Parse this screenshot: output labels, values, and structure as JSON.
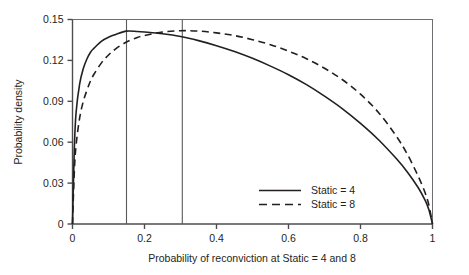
{
  "chart_data": {
    "type": "line",
    "title": "",
    "xlabel": "Probability of reconviction at Static = 4 and 8",
    "ylabel": "Probability density",
    "xlim": [
      0,
      1
    ],
    "ylim": [
      0,
      0.15
    ],
    "grid": false,
    "legend_position": "bottom-right",
    "x_ticks": [
      "0",
      "0.2",
      "0.4",
      "0.6",
      "0.8",
      "1"
    ],
    "x_tick_values": [
      0,
      0.2,
      0.4,
      0.6,
      0.8,
      1
    ],
    "y_ticks": [
      "0",
      "0.03",
      "0.06",
      "0.09",
      "0.12",
      "0.15"
    ],
    "y_tick_values": [
      0,
      0.03,
      0.06,
      0.09,
      0.12,
      0.15
    ],
    "x": [
      0,
      0.005,
      0.01,
      0.02,
      0.03,
      0.04,
      0.05,
      0.06,
      0.08,
      0.1,
      0.12,
      0.15,
      0.18,
      0.2,
      0.25,
      0.3,
      0.35,
      0.4,
      0.45,
      0.5,
      0.55,
      0.6,
      0.65,
      0.7,
      0.75,
      0.8,
      0.85,
      0.9,
      0.93,
      0.96,
      0.98,
      0.99,
      1
    ],
    "series": [
      {
        "name": "Static = 4",
        "style": "solid",
        "color": "#231f20",
        "values": [
          0,
          0.055,
          0.082,
          0.103,
          0.114,
          0.121,
          0.126,
          0.129,
          0.134,
          0.137,
          0.139,
          0.1415,
          0.1412,
          0.1408,
          0.1395,
          0.1375,
          0.1345,
          0.1308,
          0.1265,
          0.1215,
          0.1158,
          0.1095,
          0.1022,
          0.0938,
          0.0845,
          0.0738,
          0.0618,
          0.0478,
          0.0382,
          0.0268,
          0.0172,
          0.0105,
          0
        ]
      },
      {
        "name": "Static = 8",
        "style": "dashed",
        "color": "#231f20",
        "values": [
          0,
          0.038,
          0.058,
          0.078,
          0.09,
          0.098,
          0.105,
          0.11,
          0.118,
          0.124,
          0.1285,
          0.1335,
          0.1368,
          0.1382,
          0.1408,
          0.1418,
          0.1415,
          0.1402,
          0.1382,
          0.1352,
          0.1315,
          0.1268,
          0.1212,
          0.1142,
          0.1058,
          0.0952,
          0.0818,
          0.0642,
          0.0512,
          0.0352,
          0.0225,
          0.0138,
          0
        ]
      }
    ],
    "reference_lines": [
      {
        "name": "static-4-marker",
        "x": 0.15
      },
      {
        "name": "static-8-marker",
        "x": 0.305
      }
    ],
    "legend": [
      {
        "label": "Static = 4",
        "style": "solid"
      },
      {
        "label": "Static = 8",
        "style": "dashed"
      }
    ]
  }
}
